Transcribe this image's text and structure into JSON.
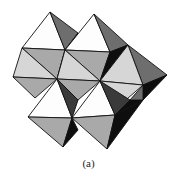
{
  "figure": {
    "caption": "(a)",
    "colors": {
      "white": "#fdfdfd",
      "light": "#d6d6d6",
      "mid": "#a9a9a9",
      "dark": "#6e6e6e",
      "darker": "#3a3a3a",
      "black": "#0e0e0e"
    },
    "faces": [
      {
        "pts": "50,12 22,48 65,50",
        "fill": "white"
      },
      {
        "pts": "50,12 65,50 78,33",
        "fill": "dark"
      },
      {
        "pts": "22,48 65,50 57,79",
        "fill": "mid"
      },
      {
        "pts": "65,50 78,33 72,60",
        "fill": "black"
      },
      {
        "pts": "65,50 72,60 57,79",
        "fill": "black"
      },
      {
        "pts": "94,14 65,50 110,52",
        "fill": "white"
      },
      {
        "pts": "94,14 110,52 128,45",
        "fill": "dark"
      },
      {
        "pts": "65,50 110,52 100,81",
        "fill": "mid"
      },
      {
        "pts": "110,52 128,45 100,81",
        "fill": "black"
      },
      {
        "pts": "128,45 167,75 143,85",
        "fill": "dark"
      },
      {
        "pts": "128,45 100,81 143,85",
        "fill": "light"
      },
      {
        "pts": "143,85 167,75 143,100",
        "fill": "black"
      },
      {
        "pts": "22,48 13,77 57,79",
        "fill": "light"
      },
      {
        "pts": "13,77 57,79 35,98",
        "fill": "mid"
      },
      {
        "pts": "57,79 100,81 65,50",
        "fill": "light"
      },
      {
        "pts": "57,79 100,81 78,100",
        "fill": "mid"
      },
      {
        "pts": "100,81 143,85 120,105",
        "fill": "light"
      },
      {
        "pts": "57,79 28,117 72,118",
        "fill": "white"
      },
      {
        "pts": "57,79 72,118 78,100",
        "fill": "darker"
      },
      {
        "pts": "28,117 72,118 63,147",
        "fill": "mid"
      },
      {
        "pts": "72,118 63,147 78,130",
        "fill": "black"
      },
      {
        "pts": "100,81 72,118 115,115",
        "fill": "white"
      },
      {
        "pts": "100,81 115,115 130,100",
        "fill": "darker"
      },
      {
        "pts": "130,100 115,115 143,100",
        "fill": "black"
      },
      {
        "pts": "143,85 143,100 130,100",
        "fill": "dark"
      },
      {
        "pts": "72,118 115,115 107,149",
        "fill": "mid"
      },
      {
        "pts": "115,115 107,149 143,100",
        "fill": "black"
      }
    ]
  }
}
